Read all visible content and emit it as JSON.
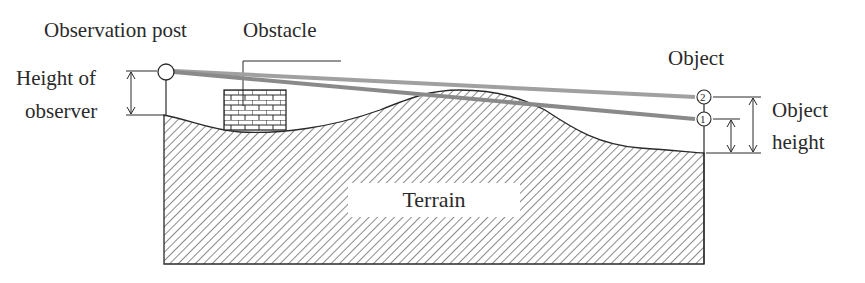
{
  "diagram": {
    "labels": {
      "observation_post": "Observation post",
      "obstacle": "Obstacle",
      "object": "Object",
      "height_of_observer_line1": "Height of",
      "height_of_observer_line2": "observer",
      "object_height_line1": "Object",
      "object_height_line2": "height",
      "terrain": "Terrain"
    },
    "markers": {
      "point_1": "1",
      "point_2": "2"
    },
    "colors": {
      "ink": "#2a2a2a",
      "sightline": "#9a9a9a",
      "sightline_blocked": "#7a7a7a",
      "background": "#ffffff"
    }
  }
}
